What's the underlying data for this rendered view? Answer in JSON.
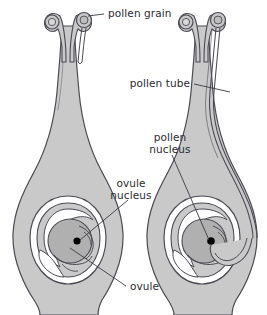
{
  "figure": {
    "background_color": "#ffffff",
    "outline_color": "#4a4a52",
    "tissue_fill": "#c9c9c9",
    "tissue_fill_light": "#d4d4d4",
    "embryo_sac_fill": "#b0b0b0",
    "nucleus_fill": "#000000",
    "text_color": "#2b2b33",
    "leader_color": "#3a3a42"
  },
  "labels": {
    "pollen_grain": "pollen grain",
    "pollen_tube": "pollen tube",
    "pollen_nucleus_line1": "pollen",
    "pollen_nucleus_line2": "nucleus",
    "ovule_nucleus_line1": "ovule",
    "ovule_nucleus_line2": "nucleus",
    "ovule": "ovule"
  },
  "panels": [
    {
      "name": "left-flower",
      "stage": "pollen grain germinating on stigma, pollen tube beginning to grow down the style",
      "parts": [
        "stigma-lobe-left",
        "stigma-lobe-right",
        "pollen-grain-left",
        "pollen-grain-right",
        "style",
        "ovary-wall",
        "ovule",
        "integument",
        "embryo-sac",
        "ovule-nucleus"
      ]
    },
    {
      "name": "right-flower",
      "stage": "pollen tube fully grown down the style and entering the ovule to reach the ovule nucleus",
      "parts": [
        "stigma-lobe-left",
        "stigma-lobe-right",
        "pollen-grain-left",
        "pollen-grain-right",
        "style",
        "pollen-tube",
        "ovary-wall",
        "ovule",
        "integument",
        "embryo-sac",
        "ovule-nucleus",
        "pollen-nucleus"
      ]
    }
  ]
}
